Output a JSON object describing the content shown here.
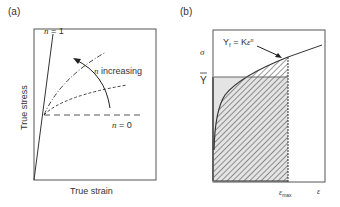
{
  "panel_a": {
    "label": "(a)",
    "xlabel": "True strain",
    "ylabel": "True stress",
    "curves": [
      {
        "label": "n = 1",
        "style": "solid"
      },
      {
        "label": "",
        "style": "dash-dot"
      },
      {
        "label": "",
        "style": "short-dash"
      },
      {
        "label": "n = 0",
        "style": "long-dash"
      }
    ],
    "annotation": "n increasing",
    "n_symbol": "n",
    "n1_rest": " = 1",
    "n0_rest": " = 0",
    "annotation_rest": " increasing"
  },
  "panel_b": {
    "label": "(b)",
    "ylabel": "σ",
    "ybar_label": "Y",
    "equation": {
      "lhs": "Y",
      "lhs_sub": "f",
      "eq": " = K",
      "eps": "ε",
      "exp": "n"
    },
    "x_max_label": {
      "eps": "ε",
      "sub": "max"
    },
    "x_label": "ε"
  }
}
